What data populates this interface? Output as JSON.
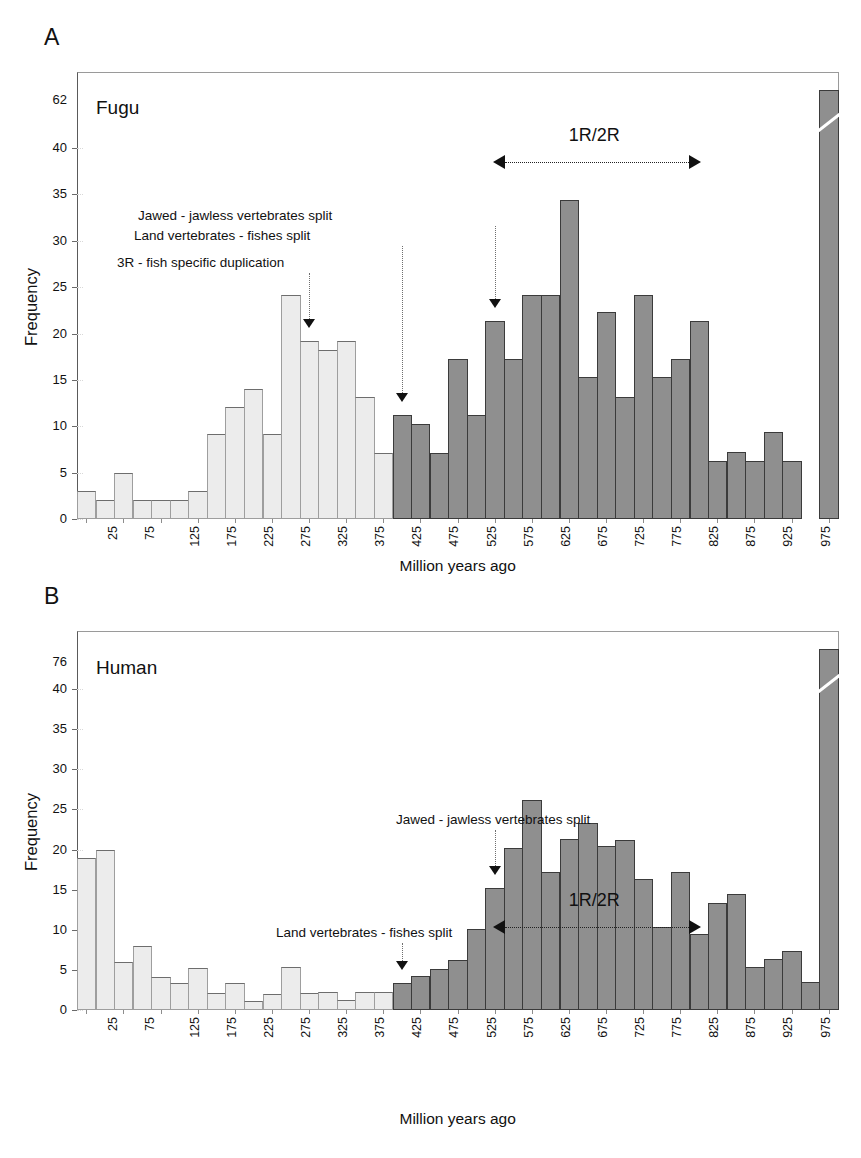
{
  "figure": {
    "panels": [
      {
        "letter": "A",
        "series_title": "Fugu",
        "xlabel": "Million years ago",
        "ylabel": "Frequency",
        "top_tick": "62"
      },
      {
        "letter": "B",
        "series_title": "Human",
        "xlabel": "Million years ago",
        "ylabel": "Frequency",
        "top_tick": "76"
      }
    ],
    "yticks": [
      "0",
      "5",
      "10",
      "15",
      "20",
      "25",
      "30",
      "35",
      "40"
    ],
    "xticks_visible": [
      "25",
      "75",
      "125",
      "175",
      "225",
      "275",
      "325",
      "375",
      "425",
      "475",
      "525",
      "575",
      "625",
      "675",
      "725",
      "775",
      "825",
      "875",
      "925",
      "975",
      ">1000"
    ],
    "annotations_a": [
      {
        "id": "jawed",
        "text": "Jawed - jawless vertebrates split"
      },
      {
        "id": "land",
        "text": "Land vertebrates - fishes split"
      },
      {
        "id": "threeR",
        "text": "3R - fish specific duplication"
      }
    ],
    "annotations_b": [
      {
        "id": "jawed",
        "text": "Jawed - jawless vertebrates split"
      },
      {
        "id": "land",
        "text": "Land vertebrates - fishes split"
      }
    ],
    "rr_label": "1R/2R",
    "colors": {
      "light_bar": "#ececec",
      "dark_bar": "#8f8f8f",
      "axis": "#6a6a6a",
      "text": "#111111"
    }
  },
  "chart_data": [
    {
      "type": "bar",
      "title": "Fugu",
      "panel": "A",
      "xlabel": "Million years ago",
      "ylabel": "Frequency",
      "ylim": [
        0,
        45
      ],
      "ytick_values": [
        0,
        5,
        10,
        15,
        20,
        25,
        30,
        35,
        40
      ],
      "axis_break_top_value": 62,
      "grid": false,
      "categories": [
        "25",
        "50",
        "75",
        "100",
        "125",
        "150",
        "175",
        "200",
        "225",
        "250",
        "275",
        "300",
        "325",
        "350",
        "375",
        "400",
        "425",
        "450",
        "475",
        "500",
        "525",
        "550",
        "575",
        "600",
        "625",
        "650",
        "675",
        "700",
        "725",
        "750",
        "775",
        "800",
        "825",
        "850",
        "875",
        "900",
        "925",
        "950",
        "975",
        "1000",
        ">1000"
      ],
      "values": [
        3.0,
        2.0,
        5.0,
        2.0,
        2.0,
        2.0,
        3.0,
        9.2,
        12.1,
        14.0,
        9.2,
        24.1,
        19.2,
        18.2,
        19.2,
        13.1,
        7.1,
        11.2,
        10.2,
        7.1,
        17.2,
        11.2,
        21.3,
        17.2,
        24.2,
        24.2,
        34.4,
        15.3,
        22.3,
        13.2,
        24.2,
        15.3,
        17.3,
        21.4,
        6.3,
        7.2,
        6.3,
        9.4,
        6.3,
        0.0,
        62.0
      ],
      "bar_shading": [
        "light",
        "light",
        "light",
        "light",
        "light",
        "light",
        "light",
        "light",
        "light",
        "light",
        "light",
        "light",
        "light",
        "light",
        "light",
        "light",
        "light",
        "dark",
        "dark",
        "dark",
        "dark",
        "dark",
        "dark",
        "dark",
        "dark",
        "dark",
        "dark",
        "dark",
        "dark",
        "dark",
        "dark",
        "dark",
        "dark",
        "dark",
        "dark",
        "dark",
        "dark",
        "dark",
        "dark",
        "dark",
        "dark"
      ],
      "annotations": [
        {
          "label": "3R - fish specific duplication",
          "x_category": "325",
          "arrow": true
        },
        {
          "label": "Land vertebrates - fishes split",
          "x_category": "450",
          "arrow": true
        },
        {
          "label": "Jawed - jawless vertebrates split",
          "x_category": "575",
          "arrow": true
        },
        {
          "label": "1R/2R",
          "span_from": "575",
          "span_to": "850",
          "type": "double-arrow"
        }
      ]
    },
    {
      "type": "bar",
      "title": "Human",
      "panel": "B",
      "xlabel": "Million years ago",
      "ylabel": "Frequency",
      "ylim": [
        0,
        45
      ],
      "ytick_values": [
        0,
        5,
        10,
        15,
        20,
        25,
        30,
        35,
        40
      ],
      "axis_break_top_value": 76,
      "grid": false,
      "categories": [
        "25",
        "50",
        "75",
        "100",
        "125",
        "150",
        "175",
        "200",
        "225",
        "250",
        "275",
        "300",
        "325",
        "350",
        "375",
        "400",
        "425",
        "450",
        "475",
        "500",
        "525",
        "550",
        "575",
        "600",
        "625",
        "650",
        "675",
        "700",
        "725",
        "750",
        "775",
        "800",
        "825",
        "850",
        "875",
        "900",
        "925",
        "950",
        "975",
        "1000",
        ">1000"
      ],
      "values": [
        19.0,
        20.0,
        6.0,
        8.0,
        4.1,
        3.4,
        5.2,
        2.1,
        3.4,
        1.1,
        2.0,
        5.3,
        2.1,
        2.2,
        1.2,
        2.2,
        2.2,
        3.4,
        4.2,
        5.1,
        6.2,
        10.1,
        15.2,
        20.2,
        26.2,
        17.2,
        21.3,
        23.3,
        20.4,
        21.2,
        16.3,
        10.3,
        17.2,
        9.5,
        13.3,
        14.4,
        5.4,
        6.4,
        7.4,
        3.5,
        76.0
      ],
      "bar_shading": [
        "light",
        "light",
        "light",
        "light",
        "light",
        "light",
        "light",
        "light",
        "light",
        "light",
        "light",
        "light",
        "light",
        "light",
        "light",
        "light",
        "light",
        "dark",
        "dark",
        "dark",
        "dark",
        "dark",
        "dark",
        "dark",
        "dark",
        "dark",
        "dark",
        "dark",
        "dark",
        "dark",
        "dark",
        "dark",
        "dark",
        "dark",
        "dark",
        "dark",
        "dark",
        "dark",
        "dark",
        "dark",
        "dark"
      ],
      "annotations": [
        {
          "label": "Land vertebrates - fishes split",
          "x_category": "450",
          "arrow": true
        },
        {
          "label": "Jawed - jawless vertebrates split",
          "x_category": "575",
          "arrow": true
        },
        {
          "label": "1R/2R",
          "span_from": "575",
          "span_to": "850",
          "type": "double-arrow"
        }
      ]
    }
  ]
}
